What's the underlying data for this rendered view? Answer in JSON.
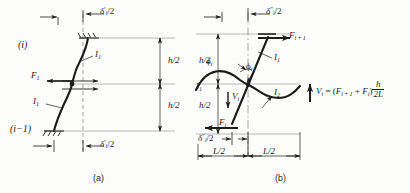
{
  "figure": {
    "background_color": "#fdfdfc",
    "ink_color": "#1c1c1c",
    "panels": [
      {
        "key": "a",
        "caption": "(a)"
      },
      {
        "key": "b",
        "caption": "(b)"
      }
    ]
  },
  "panel_a": {
    "caption": "(a)",
    "top_delta": {
      "delta": "δ",
      "prime": "′",
      "sub": "i",
      "over": "/2"
    },
    "bottom_delta": {
      "delta": "δ",
      "prime": "′",
      "sub": "i",
      "over": "/2"
    },
    "story_level_upper": "(i)",
    "story_level_lower": "(i−1)",
    "force_label": {
      "symbol": "F",
      "sub": "1"
    },
    "inertia_upper": {
      "symbol": "I",
      "sub": "1"
    },
    "inertia_lower": {
      "symbol": "I",
      "sub": "1"
    },
    "dim_upper": "h/2",
    "dim_lower": "h/2"
  },
  "panel_b": {
    "caption": "(b)",
    "top_delta": {
      "delta": "δ",
      "prime": "″",
      "sub": "i",
      "over": "/2"
    },
    "bottom_delta": {
      "delta": "δ",
      "prime": "″",
      "sub": "i",
      "over": "/2"
    },
    "force_top": {
      "symbol": "F",
      "sub": "i + 1"
    },
    "force_bottom": {
      "symbol": "F",
      "sub": "i"
    },
    "shear_label": {
      "symbol": "V",
      "sub": "i"
    },
    "rotation_left": {
      "symbol": "ϕ",
      "sub": "i"
    },
    "rotation_right": {
      "symbol": "ϕ",
      "sub": "i"
    },
    "inertia_upper": {
      "symbol": "I",
      "sub": "1"
    },
    "inertia_lower": {
      "symbol": "I",
      "sub": "2"
    },
    "inertia_left": {
      "symbol": "I",
      "sub": "1"
    },
    "dim_upper": "h/2",
    "dim_lower": "h/2",
    "span_left": "L/2",
    "span_right": "L/2",
    "equation": {
      "lhs": "V",
      "lhs_sub": "i",
      "eq": "=",
      "open": "(",
      "term1": "F",
      "term1_sub": "i + 1",
      "plus": "+",
      "term2": "F",
      "term2_sub": "i",
      "close": ")",
      "frac_num": "h",
      "frac_den": "2L",
      "full": "Vᵢ = (Fᵢ₊₁ + Fᵢ) h/2L"
    }
  }
}
